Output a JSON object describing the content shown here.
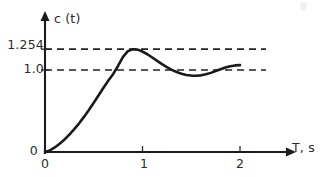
{
  "chart_data": {
    "type": "line",
    "title": "",
    "subtitle": "",
    "xlabel": "T, s",
    "ylabel": "c (t)",
    "xlim": [
      0,
      2.55
    ],
    "ylim": [
      0,
      1.55
    ],
    "grid": false,
    "legend": null,
    "x_ticks": [
      {
        "value": 0,
        "label": "0"
      },
      {
        "value": 1,
        "label": "1"
      },
      {
        "value": 2,
        "label": "2"
      }
    ],
    "y_ticks": [
      {
        "value": 0,
        "label": "0"
      },
      {
        "value": 1.0,
        "label": "1.0"
      },
      {
        "value": 1.254,
        "label": "1.254"
      }
    ],
    "reference_lines": [
      {
        "label": "1.254",
        "value": 1.254,
        "style": "dashed",
        "orientation": "horizontal"
      },
      {
        "label": "1.0",
        "value": 1.0,
        "style": "dashed",
        "orientation": "horizontal"
      }
    ],
    "annotations": [
      {
        "text": "overshoot peak 1.254 at t = 0.85 s"
      },
      {
        "text": "steady-state value 1.0"
      }
    ],
    "series": [
      {
        "name": "c (t)",
        "color": "#1a1a1a",
        "x": [
          0.0,
          0.05,
          0.1,
          0.15,
          0.2,
          0.25,
          0.3,
          0.35,
          0.4,
          0.45,
          0.5,
          0.55,
          0.6,
          0.65,
          0.7,
          0.75,
          0.8,
          0.85,
          0.9,
          0.95,
          1.0,
          1.05,
          1.1,
          1.15,
          1.2,
          1.25,
          1.3,
          1.35,
          1.4,
          1.45,
          1.5,
          1.55,
          1.6,
          1.65,
          1.7,
          1.75,
          1.8,
          1.85,
          1.9,
          1.95,
          2.0
        ],
        "y": [
          0.0,
          0.02,
          0.055,
          0.1,
          0.152,
          0.212,
          0.278,
          0.35,
          0.428,
          0.512,
          0.6,
          0.692,
          0.784,
          0.872,
          0.952,
          1.052,
          1.16,
          1.23,
          1.254,
          1.248,
          1.225,
          1.192,
          1.152,
          1.112,
          1.072,
          1.035,
          1.002,
          0.976,
          0.955,
          0.94,
          0.932,
          0.93,
          0.935,
          0.947,
          0.965,
          0.988,
          1.01,
          1.03,
          1.046,
          1.056,
          1.06
        ]
      }
    ]
  },
  "labels": {
    "y_axis_title": "c (t)",
    "x_axis_title": "T, s",
    "y_tick_origin": "0",
    "y_tick_one": "1.254",
    "y_tick_two": "1.0",
    "x_tick_zero": "0",
    "x_tick_one": "1",
    "x_tick_two": "2"
  },
  "colors": {
    "curve": "#1a1a1a",
    "axis": "#1c1c1c",
    "reference": "#232323",
    "background": "#ffffff",
    "text": "#2b2b2b"
  }
}
